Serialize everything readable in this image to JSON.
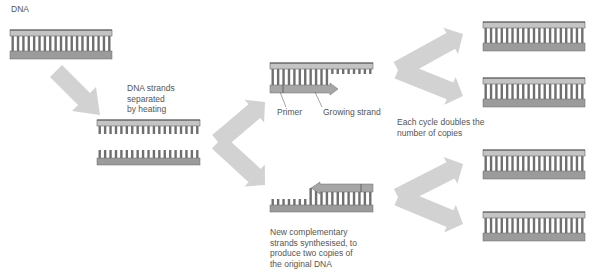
{
  "labels": {
    "dna": "DNA",
    "separated": "DNA strands\nseparated\nby heating",
    "primer": "Primer",
    "growing_strand": "Growing strand",
    "each_cycle": "Each cycle doubles the\nnumber of copies",
    "new_complementary": "New complementary\nstrands synthesised, to\nproduce two copies of\nthe original DNA"
  },
  "colors": {
    "backbone_light": "#c4c4c4",
    "backbone_dark": "#9b9b9b",
    "backbone_edge": "#6a6a6a",
    "rungs": "#6f6f6f",
    "arrow": "#d2d2d2",
    "new_strand": "#a6a6a6",
    "text": "#555555"
  },
  "diagram": {
    "stages": [
      {
        "id": "original-dna",
        "description": "Double-stranded DNA"
      },
      {
        "id": "separated",
        "description": "Two single strands after heating"
      },
      {
        "id": "extension",
        "description": "Primers bind and strands grow"
      },
      {
        "id": "copies",
        "description": "Four double-stranded copies after doubling"
      }
    ],
    "rung_count": 19
  }
}
